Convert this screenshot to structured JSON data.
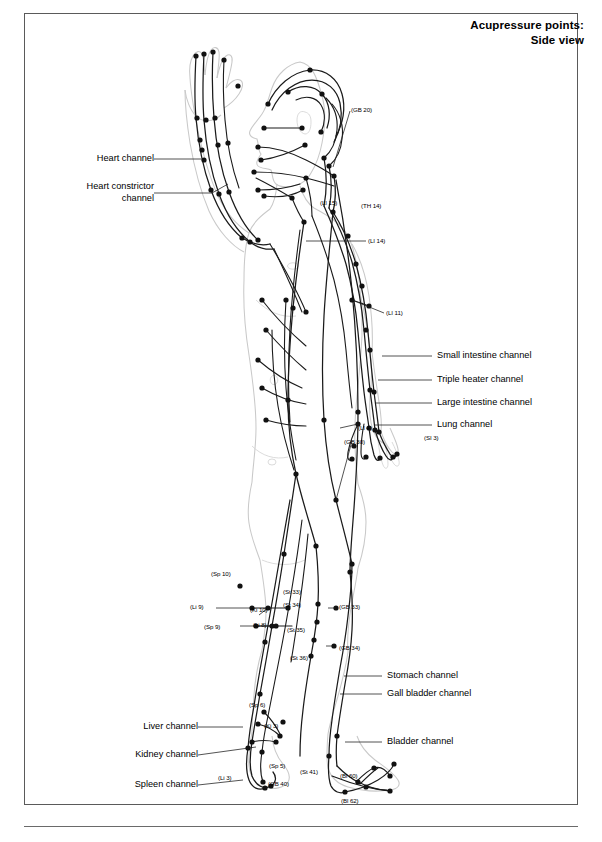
{
  "title": {
    "line1": "Acupressure points:",
    "line2": "Side view"
  },
  "channel_labels": {
    "left": [
      {
        "name": "heart",
        "text": "Heart channel"
      },
      {
        "name": "heart-constrictor",
        "text": "Heart constrictor"
      },
      {
        "name": "heart-constrictor-2",
        "text": "channel"
      },
      {
        "name": "liver",
        "text": "Liver channel"
      },
      {
        "name": "kidney",
        "text": "Kidney channel"
      },
      {
        "name": "spleen",
        "text": "Spleen channel"
      }
    ],
    "right": [
      {
        "name": "small-intestine",
        "text": "Small intestine channel"
      },
      {
        "name": "triple-heater",
        "text": "Triple heater channel"
      },
      {
        "name": "large-intestine",
        "text": "Large intestine channel"
      },
      {
        "name": "lung",
        "text": "Lung channel"
      },
      {
        "name": "stomach",
        "text": "Stomach channel"
      },
      {
        "name": "gall-bladder",
        "text": "Gall bladder channel"
      },
      {
        "name": "bladder",
        "text": "Bladder channel"
      }
    ]
  },
  "point_codes": [
    {
      "name": "gb-20",
      "text": "(GB 20)"
    },
    {
      "name": "li-15",
      "text": "(LI 15)"
    },
    {
      "name": "th-14",
      "text": "(TH 14)"
    },
    {
      "name": "li-14",
      "text": "(LI 14)"
    },
    {
      "name": "li-11",
      "text": "(LI 11)"
    },
    {
      "name": "li-4",
      "text": "(LI 4)"
    },
    {
      "name": "si-3",
      "text": "(SI 3)"
    },
    {
      "name": "gb-30",
      "text": "(GB 30)"
    },
    {
      "name": "sp-10",
      "text": "(Sp 10)"
    },
    {
      "name": "li-9",
      "text": "(Li 9)"
    },
    {
      "name": "ki-10",
      "text": "(Ki 10)"
    },
    {
      "name": "sp-9",
      "text": "(Sp 9)"
    },
    {
      "name": "li-8",
      "text": "(Li 8)"
    },
    {
      "name": "st-33",
      "text": "(St 33)"
    },
    {
      "name": "st-34",
      "text": "(St 34)"
    },
    {
      "name": "gb-33",
      "text": "(GB 33)"
    },
    {
      "name": "st-35",
      "text": "(St 35)"
    },
    {
      "name": "gb-34",
      "text": "(GB 34)"
    },
    {
      "name": "st-36",
      "text": "(St 36)"
    },
    {
      "name": "sp-6",
      "text": "(Sp 6)"
    },
    {
      "name": "ki-3",
      "text": "(Ki 3)"
    },
    {
      "name": "sp-5",
      "text": "(Sp 5)"
    },
    {
      "name": "li-3",
      "text": "(Li 3)"
    },
    {
      "name": "gb-40",
      "text": "(GB 40)"
    },
    {
      "name": "st-41",
      "text": "(St 41)"
    },
    {
      "name": "bl-60",
      "text": "(Bl 60)"
    },
    {
      "name": "bl-62",
      "text": "(Bl 62)"
    }
  ],
  "colors": {
    "ink": "#1a1a1a",
    "body_outline": "#c9c9c9",
    "frame": "#5a5a5a",
    "background": "#ffffff"
  }
}
